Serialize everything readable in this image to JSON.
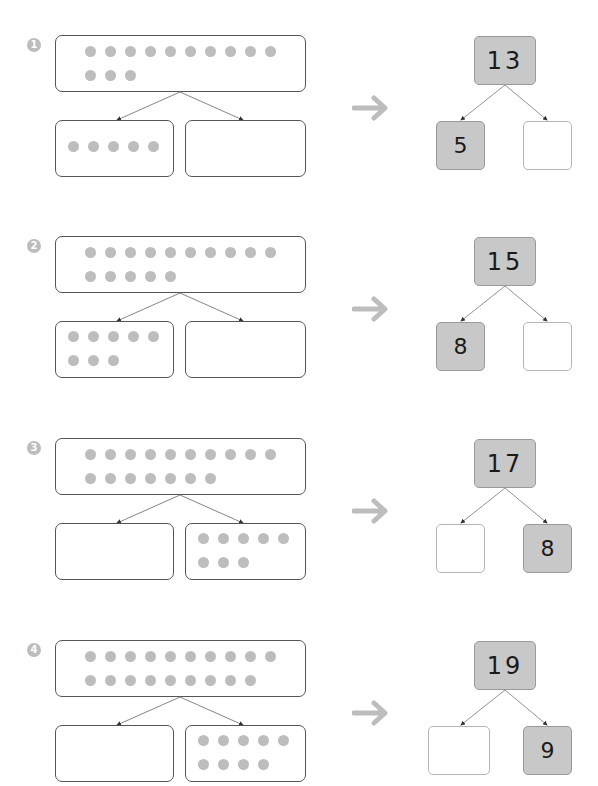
{
  "worksheet": {
    "problems": [
      {
        "number": "1",
        "whole_dots": 13,
        "left_part_dots": 5,
        "right_part_dots": 0,
        "tree": {
          "whole": "13",
          "left": "5",
          "right": ""
        }
      },
      {
        "number": "2",
        "whole_dots": 15,
        "left_part_dots": 8,
        "right_part_dots": 0,
        "tree": {
          "whole": "15",
          "left": "8",
          "right": ""
        }
      },
      {
        "number": "3",
        "whole_dots": 17,
        "left_part_dots": 0,
        "right_part_dots": 8,
        "tree": {
          "whole": "17",
          "left": "",
          "right": "8"
        }
      },
      {
        "number": "4",
        "whole_dots": 19,
        "left_part_dots": 0,
        "right_part_dots": 9,
        "tree": {
          "whole": "19",
          "left": "",
          "right": "9"
        }
      }
    ],
    "icons": {
      "transform_arrow": "right-arrow-icon",
      "split_arrows": "down-arrow-icon"
    },
    "colors": {
      "dot": "#bdbdbd",
      "filled_box": "#c8c8c8",
      "box_border": "#555555",
      "arrow": "#bdbdbd"
    }
  }
}
